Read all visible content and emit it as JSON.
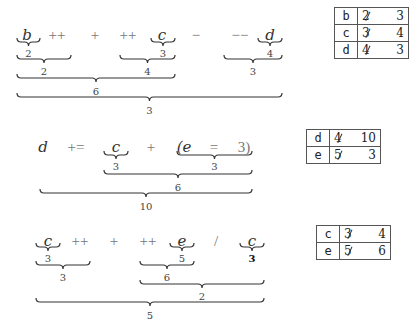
{
  "expressions": [
    {
      "tokens": [
        {
          "text": "b",
          "kind": "var",
          "x": 27,
          "y": 28
        },
        {
          "text": "++",
          "kind": "op",
          "x": 57,
          "y": 28
        },
        {
          "text": "+",
          "kind": "op",
          "x": 95,
          "y": 28
        },
        {
          "text": "++",
          "kind": "op",
          "x": 128,
          "y": 28
        },
        {
          "text": "c",
          "kind": "var",
          "x": 162,
          "y": 28
        },
        {
          "text": "−",
          "kind": "op",
          "x": 196,
          "y": 28
        },
        {
          "text": "−−",
          "kind": "op",
          "x": 240,
          "y": 28
        },
        {
          "text": "d",
          "kind": "var",
          "x": 270,
          "y": 28
        }
      ],
      "braces": [
        {
          "x1": 17,
          "x2": 40,
          "y": 42,
          "label": "2",
          "ly": 49
        },
        {
          "x1": 151,
          "x2": 175,
          "y": 42,
          "label": "3",
          "ly": 49
        },
        {
          "x1": 258,
          "x2": 282,
          "y": 42,
          "label": "4",
          "ly": 49
        },
        {
          "x1": 17,
          "x2": 71,
          "y": 59,
          "label": "2",
          "ly": 67
        },
        {
          "x1": 120,
          "x2": 175,
          "y": 59,
          "label": "4",
          "ly": 67
        },
        {
          "x1": 224,
          "x2": 282,
          "y": 59,
          "label": "3",
          "ly": 67
        },
        {
          "x1": 17,
          "x2": 175,
          "y": 78,
          "label": "6",
          "ly": 87
        },
        {
          "x1": 17,
          "x2": 282,
          "y": 97,
          "label": "3",
          "ly": 106
        }
      ]
    },
    {
      "tokens": [
        {
          "text": "d",
          "kind": "var",
          "x": 43,
          "y": 140
        },
        {
          "text": "+=",
          "kind": "op",
          "x": 76,
          "y": 140
        },
        {
          "text": "c",
          "kind": "var",
          "x": 116,
          "y": 140
        },
        {
          "text": "+",
          "kind": "op",
          "x": 151,
          "y": 140
        },
        {
          "text": "(e",
          "kind": "var",
          "x": 184,
          "y": 140
        },
        {
          "text": "=",
          "kind": "op",
          "x": 214,
          "y": 140
        },
        {
          "text": "3)",
          "kind": "op",
          "x": 244,
          "y": 140
        }
      ],
      "braces": [
        {
          "x1": 104,
          "x2": 128,
          "y": 155,
          "label": "3",
          "ly": 162
        },
        {
          "x1": 177,
          "x2": 252,
          "y": 155,
          "label": "3",
          "ly": 162
        },
        {
          "x1": 104,
          "x2": 252,
          "y": 174,
          "label": "6",
          "ly": 183
        },
        {
          "x1": 40,
          "x2": 252,
          "y": 193,
          "label": "10",
          "ly": 202
        }
      ]
    },
    {
      "tokens": [
        {
          "text": "c",
          "kind": "var",
          "x": 48,
          "y": 234
        },
        {
          "text": "++",
          "kind": "op",
          "x": 80,
          "y": 234
        },
        {
          "text": "+",
          "kind": "op",
          "x": 114,
          "y": 234
        },
        {
          "text": "++",
          "kind": "op",
          "x": 148,
          "y": 234
        },
        {
          "text": "e",
          "kind": "var",
          "x": 182,
          "y": 234
        },
        {
          "text": "/",
          "kind": "op",
          "x": 216,
          "y": 234
        },
        {
          "text": "c",
          "kind": "var",
          "x": 252,
          "y": 234
        }
      ],
      "braces": [
        {
          "x1": 36,
          "x2": 60,
          "y": 247,
          "label": "3",
          "ly": 254
        },
        {
          "x1": 170,
          "x2": 194,
          "y": 247,
          "label": "5",
          "ly": 254
        },
        {
          "x1": 240,
          "x2": 264,
          "y": 247,
          "label": "3",
          "ly": 254,
          "bold": true
        },
        {
          "x1": 36,
          "x2": 90,
          "y": 265,
          "label": "3",
          "ly": 273
        },
        {
          "x1": 140,
          "x2": 194,
          "y": 265,
          "label": "6",
          "ly": 273
        },
        {
          "x1": 140,
          "x2": 264,
          "y": 284,
          "label": "2",
          "ly": 292
        },
        {
          "x1": 36,
          "x2": 264,
          "y": 302,
          "label": "5",
          "ly": 311
        }
      ]
    }
  ],
  "state_tables": [
    {
      "left": 334,
      "top": 7,
      "rows": [
        {
          "name": "b",
          "old": "2",
          "new": "3"
        },
        {
          "name": "c",
          "old": "3",
          "new": "4"
        },
        {
          "name": "d",
          "old": "4",
          "new": "3"
        }
      ]
    },
    {
      "left": 306,
      "top": 129,
      "rows": [
        {
          "name": "d",
          "old": "4",
          "new": "10"
        },
        {
          "name": "e",
          "old": "5",
          "new": "3"
        }
      ]
    },
    {
      "left": 316,
      "top": 225,
      "rows": [
        {
          "name": "c",
          "old": "3",
          "new": "4"
        },
        {
          "name": "e",
          "old": "5",
          "new": "6"
        }
      ]
    }
  ]
}
